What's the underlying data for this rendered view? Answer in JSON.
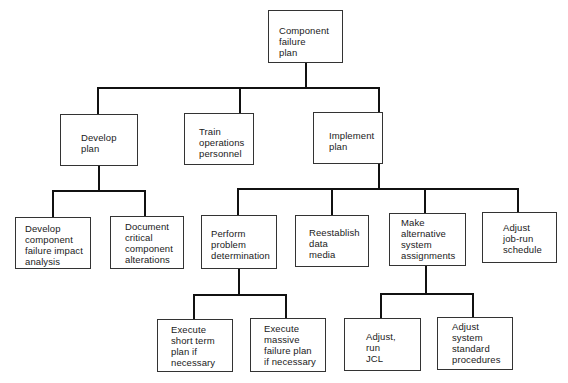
{
  "diagram": {
    "type": "hierarchy",
    "root": {
      "label": "Component\nfailure\nplan"
    },
    "level1": [
      {
        "label": "Develop\nplan"
      },
      {
        "label": "Train\noperations\npersonnel"
      },
      {
        "label": "Implement\nplan"
      }
    ],
    "develop_children": [
      {
        "label": "Develop\ncomponent\nfailure impact\nanalysis"
      },
      {
        "label": "Document\ncritical\ncomponent\nalterations"
      }
    ],
    "implement_children": [
      {
        "label": "Perform\nproblem\ndetermination"
      },
      {
        "label": "Reestablish\ndata\nmedia"
      },
      {
        "label": "Make\nalternative\nsystem\nassignments"
      },
      {
        "label": "Adjust\njob-run\nschedule"
      }
    ],
    "perform_children": [
      {
        "label": "Execute\nshort term\nplan if\nnecessary"
      },
      {
        "label": "Execute\nmassive\nfailure plan\nif necessary"
      }
    ],
    "make_alternative_children": [
      {
        "label": "Adjust,\nrun\nJCL"
      },
      {
        "label": "Adjust\nsystem\nstandard\nprocedures"
      }
    ],
    "colors": {
      "line": "#111111",
      "box_border": "#333333",
      "background": "#ffffff",
      "text": "#1a1a1a"
    }
  }
}
